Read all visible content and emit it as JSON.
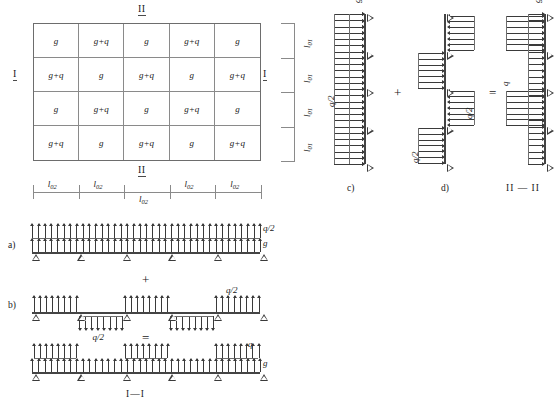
{
  "figure": {
    "title_markers": {
      "section_I": "I",
      "section_II": "II",
      "section_I_I": "I—I",
      "section_II_II": "II — II"
    },
    "plan": {
      "rows": 4,
      "cols": 5,
      "cells": [
        [
          "g",
          "g+q",
          "g",
          "g+q",
          "g"
        ],
        [
          "g+q",
          "g",
          "g+q",
          "g",
          "g+q"
        ],
        [
          "g",
          "g+q",
          "g",
          "g+q",
          "g"
        ],
        [
          "g+q",
          "g",
          "g+q",
          "g",
          "g+q"
        ]
      ],
      "dim_horizontal_label": "l02",
      "dim_horizontal_sub": "02",
      "dim_horizontal_base": "l",
      "dim_horizontal_count": 5,
      "dim_vertical_base": "l",
      "dim_vertical_sub": "01",
      "dim_vertical_count": 4
    },
    "panels": {
      "a": {
        "label": "a)",
        "loads": [
          "q/2",
          "g"
        ],
        "supports": 6,
        "spans": 5
      },
      "b": {
        "label": "b)",
        "load_up": "q/2",
        "load_down": "q/2",
        "supports": 6,
        "spans": 5
      },
      "result_I": {
        "label": "I—I",
        "loads": [
          "q",
          "g"
        ],
        "supports": 6,
        "spans": 5
      },
      "c": {
        "label": "c)",
        "loads": [
          "g",
          "q/2"
        ],
        "supports": 5,
        "spans": 4
      },
      "d": {
        "label": "d)",
        "load_a": "q/2",
        "load_b": "q/2",
        "supports": 5,
        "spans": 4
      },
      "result_II": {
        "label": "II — II",
        "loads": [
          "g",
          "q"
        ],
        "supports": 5,
        "spans": 4
      }
    },
    "operators": {
      "plus": "+",
      "equals": "="
    },
    "colors": {
      "grid_line": "#8a8a8a",
      "border": "#6d6d6d",
      "ink": "#3a3a3a",
      "dim": "#8a8a8a"
    }
  }
}
